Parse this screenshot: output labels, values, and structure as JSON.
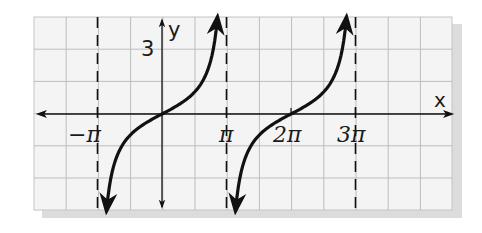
{
  "chart_data": {
    "type": "line",
    "title": "",
    "function": "y = tan(x/2)",
    "xlabel": "x",
    "ylabel": "y",
    "x_tick_labels": [
      "−π",
      "π",
      "2π",
      "3π"
    ],
    "x_tick_values_in_pi": [
      -1,
      1,
      2,
      3
    ],
    "y_tick_labels": [
      "3"
    ],
    "y_tick_values": [
      3
    ],
    "asymptotes_in_pi": [
      -1,
      1,
      3
    ],
    "asymptote_style": "dashed",
    "series": [
      {
        "name": "branch-1",
        "center_in_pi": 0,
        "x_range_in_pi": [
          -0.86,
          0.86
        ],
        "points": [
          [
            -2.7,
            -4.5
          ],
          [
            -1.57,
            -1
          ],
          [
            0,
            0
          ],
          [
            1.57,
            1
          ],
          [
            2.7,
            4.5
          ]
        ]
      },
      {
        "name": "branch-2",
        "center_in_pi": 2,
        "x_range_in_pi": [
          1.14,
          2.86
        ],
        "points": [
          [
            3.58,
            -4.5
          ],
          [
            4.71,
            -1
          ],
          [
            6.28,
            0
          ],
          [
            7.85,
            1
          ],
          [
            8.98,
            4.5
          ]
        ]
      }
    ],
    "xlim_in_pi": [
      -2.0,
      4.5
    ],
    "ylim": [
      -4.5,
      4.5
    ],
    "grid": true,
    "legend": null
  },
  "labels": {
    "x_axis": "x",
    "y_axis": "y",
    "y_tick": "3",
    "neg_pi": "−π",
    "pi": "π",
    "two_pi": "2π",
    "three_pi": "3π"
  },
  "colors": {
    "grid_line": "#bdbdbd",
    "grid_bg": "#f4f4f4",
    "shadow": "#dcdcdc",
    "ink": "#111111"
  }
}
